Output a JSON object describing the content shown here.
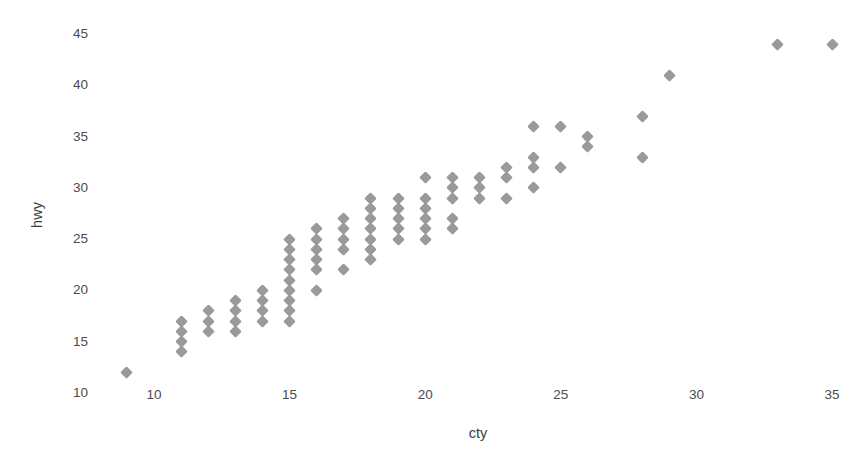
{
  "chart_data": {
    "type": "scatter",
    "title": "",
    "xlabel": "cty",
    "ylabel": "hwy",
    "xlim": [
      8,
      36
    ],
    "ylim": [
      9.5,
      46
    ],
    "xticks": [
      10,
      15,
      20,
      25,
      30,
      35
    ],
    "yticks": [
      10,
      15,
      20,
      25,
      30,
      35,
      40,
      45
    ],
    "xtick_labels": [
      "10",
      "15",
      "20",
      "25",
      "30",
      "35"
    ],
    "ytick_labels": [
      "10",
      "15",
      "20",
      "25",
      "30",
      "35",
      "40",
      "45"
    ],
    "grid": false,
    "legend": null,
    "marker": "diamond",
    "marker_color": "#9a9a9a",
    "marker_size": 9,
    "background_color": "#ffffff",
    "axis_label_color": "#3c3c3c",
    "tick_label_color": "#4b4b4b",
    "x": [
      9,
      11,
      11,
      11,
      11,
      12,
      12,
      12,
      13,
      13,
      13,
      13,
      14,
      14,
      14,
      14,
      15,
      15,
      15,
      15,
      15,
      15,
      15,
      15,
      15,
      16,
      16,
      16,
      16,
      16,
      16,
      17,
      17,
      17,
      17,
      17,
      18,
      18,
      18,
      18,
      18,
      18,
      18,
      19,
      19,
      19,
      19,
      19,
      20,
      20,
      20,
      20,
      20,
      20,
      21,
      21,
      21,
      21,
      21,
      22,
      22,
      22,
      23,
      23,
      23,
      24,
      24,
      24,
      24,
      25,
      25,
      26,
      26,
      28,
      28,
      29,
      33,
      35
    ],
    "y": [
      12,
      17,
      16,
      15,
      14,
      18,
      17,
      16,
      19,
      18,
      17,
      16,
      20,
      19,
      18,
      17,
      25,
      24,
      23,
      22,
      21,
      20,
      19,
      18,
      17,
      26,
      25,
      24,
      23,
      22,
      20,
      27,
      26,
      25,
      24,
      22,
      29,
      28,
      27,
      26,
      25,
      24,
      23,
      29,
      28,
      27,
      26,
      25,
      31,
      29,
      28,
      27,
      26,
      25,
      31,
      30,
      29,
      27,
      26,
      31,
      30,
      29,
      32,
      31,
      29,
      36,
      33,
      32,
      30,
      36,
      32,
      35,
      34,
      37,
      33,
      41,
      44,
      44
    ]
  },
  "axes": {
    "x_axis_name": "cty-axis",
    "y_axis_name": "hwy-axis"
  }
}
